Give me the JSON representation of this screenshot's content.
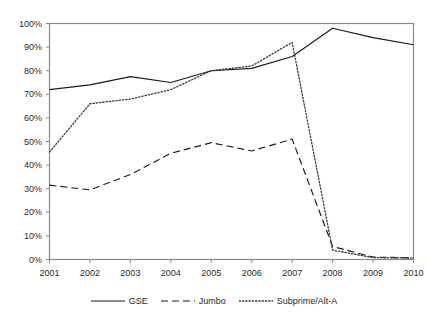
{
  "chart_data": {
    "type": "line",
    "title": "",
    "subtitle": "",
    "xlabel": "",
    "ylabel": "",
    "categories": [
      "2001",
      "2002",
      "2003",
      "2004",
      "2005",
      "2006",
      "2007",
      "2008",
      "2009",
      "2010"
    ],
    "x": [
      2001,
      2002,
      2003,
      2004,
      2005,
      2006,
      2007,
      2008,
      2009,
      2010
    ],
    "xlim": [
      2001,
      2010
    ],
    "ylim": [
      0,
      100
    ],
    "ytick_labels": [
      "0%",
      "10%",
      "20%",
      "30%",
      "40%",
      "50%",
      "60%",
      "70%",
      "80%",
      "90%",
      "100%"
    ],
    "ytick_values": [
      0,
      10,
      20,
      30,
      40,
      50,
      60,
      70,
      80,
      90,
      100
    ],
    "grid": false,
    "legend_position": "bottom",
    "series": [
      {
        "name": "GSE",
        "style": "solid",
        "color": "#1a1a1a",
        "values": [
          72,
          74,
          77.5,
          75,
          80,
          81,
          86,
          98,
          94,
          91
        ]
      },
      {
        "name": "Jumbo",
        "style": "dashed",
        "color": "#1a1a1a",
        "values": [
          31.5,
          29.5,
          36,
          45,
          49.5,
          46,
          51,
          5.5,
          1,
          0.7
        ]
      },
      {
        "name": "Subprime/Alt-A",
        "style": "dotted",
        "color": "#3a3a3a",
        "values": [
          45.5,
          66,
          68,
          72,
          80,
          82,
          92,
          4,
          0.8,
          0.6
        ]
      }
    ]
  },
  "legend": {
    "entries": [
      {
        "label": "GSE",
        "swatch": "solid-line-swatch"
      },
      {
        "label": "Jumbo",
        "swatch": "dashed-line-swatch"
      },
      {
        "label": "Subprime/Alt-A",
        "swatch": "dotted-line-swatch"
      }
    ]
  },
  "footer": {
    "text": ""
  }
}
